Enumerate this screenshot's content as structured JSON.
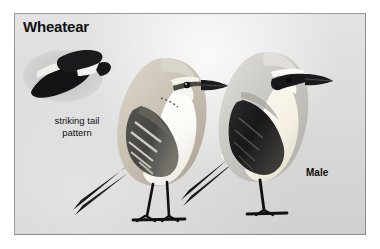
{
  "plate": {
    "title": "Wheatear",
    "background_color": "#d7d7d7",
    "page_color": "#ffffff",
    "border_color": "#9a9a9a"
  },
  "annotations": {
    "tail_caption_line1": "striking tail",
    "tail_caption_line2": "pattern",
    "female_label": "Female",
    "male_label": "Male"
  },
  "figures": [
    {
      "name": "tail-pattern-inset",
      "description": "striking tail pattern",
      "ink_color": "#15151a",
      "white_color": "#f4f4f2"
    },
    {
      "name": "female-wheatear",
      "sex": "Female",
      "upperpart_color": "#c9c2b4",
      "underpart_color": "#fbfaf7",
      "wing_color": "#3a3a3c",
      "tail_color": "#17171a",
      "bill_color": "#1b1b1e",
      "leg_color": "#121214"
    },
    {
      "name": "male-wheatear",
      "sex": "Male",
      "upperpart_color": "#c4c2bd",
      "underpart_color": "#f7f4ec",
      "mask_color": "#18181b",
      "wing_color": "#1c1c1f",
      "tail_color": "#141417",
      "bill_color": "#1b1b1e",
      "leg_color": "#121214"
    }
  ]
}
